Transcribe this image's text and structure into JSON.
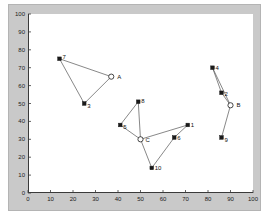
{
  "figure": {
    "width": 269,
    "height": 220,
    "frame_color": "#c9c9c9",
    "plot_background": "#ffffff",
    "axis_color": "#3a3a3a",
    "edge_color": "#555555",
    "node_color": "#1a1a1a",
    "center_color": "#ffffff"
  },
  "chart_data": {
    "type": "scatter",
    "title": "",
    "xlabel": "",
    "ylabel": "",
    "xlim": [
      0,
      100
    ],
    "ylim": [
      0,
      100
    ],
    "grid": false,
    "legend": "none",
    "xticks": [
      0,
      10,
      20,
      30,
      40,
      50,
      60,
      70,
      80,
      90,
      100
    ],
    "yticks": [
      0,
      10,
      20,
      30,
      40,
      50,
      60,
      70,
      80,
      90,
      100
    ],
    "xtick_labels": [
      "0",
      "10",
      "20",
      "30",
      "40",
      "50",
      "60",
      "70",
      "80",
      "90",
      "100"
    ],
    "ytick_labels": [
      "0",
      "10",
      "20",
      "30",
      "40",
      "50",
      "60",
      "70",
      "80",
      "90",
      "100"
    ],
    "series": [
      {
        "name": "nodes",
        "marker": "filled-square",
        "points": [
          {
            "label": "7",
            "x": 14,
            "y": 75,
            "label_dx": 3,
            "label_dy": -5
          },
          {
            "label": "3",
            "x": 25,
            "y": 50,
            "label_dx": 3,
            "label_dy": -1
          },
          {
            "label": "8",
            "x": 49,
            "y": 51,
            "label_dx": 3,
            "label_dy": -4
          },
          {
            "label": "5",
            "x": 41,
            "y": 38,
            "label_dx": 3,
            "label_dy": -1
          },
          {
            "label": "10",
            "x": 55,
            "y": 14,
            "label_dx": 3,
            "label_dy": 0
          },
          {
            "label": "6",
            "x": 65,
            "y": 31,
            "label_dx": 3,
            "label_dy": -3
          },
          {
            "label": "1",
            "x": 71,
            "y": 38,
            "label_dx": 3,
            "label_dy": -3
          },
          {
            "label": "4",
            "x": 82,
            "y": 70,
            "label_dx": 3,
            "label_dy": -3
          },
          {
            "label": "2",
            "x": 86,
            "y": 56,
            "label_dx": 3,
            "label_dy": -2
          },
          {
            "label": "9",
            "x": 86,
            "y": 31,
            "label_dx": 3,
            "label_dy": -1
          }
        ]
      },
      {
        "name": "cluster-centers",
        "marker": "open-circle",
        "points": [
          {
            "label": "A",
            "x": 37,
            "y": 65,
            "label_dx": 6,
            "label_dy": -3
          },
          {
            "label": "B",
            "x": 90,
            "y": 49,
            "label_dx": 6,
            "label_dy": -3
          },
          {
            "label": "C",
            "x": 50,
            "y": 30,
            "label_dx": 5,
            "label_dy": -2
          }
        ]
      }
    ],
    "edges": [
      {
        "from": [
          14,
          75
        ],
        "to": [
          25,
          50
        ]
      },
      {
        "from": [
          14,
          75
        ],
        "to": [
          37,
          65
        ]
      },
      {
        "from": [
          25,
          50
        ],
        "to": [
          37,
          65
        ]
      },
      {
        "from": [
          49,
          51
        ],
        "to": [
          41,
          38
        ]
      },
      {
        "from": [
          49,
          51
        ],
        "to": [
          50,
          30
        ]
      },
      {
        "from": [
          41,
          38
        ],
        "to": [
          50,
          30
        ]
      },
      {
        "from": [
          50,
          30
        ],
        "to": [
          55,
          14
        ]
      },
      {
        "from": [
          50,
          30
        ],
        "to": [
          71,
          38
        ]
      },
      {
        "from": [
          55,
          14
        ],
        "to": [
          65,
          31
        ]
      },
      {
        "from": [
          65,
          31
        ],
        "to": [
          71,
          38
        ]
      },
      {
        "from": [
          82,
          70
        ],
        "to": [
          86,
          56
        ]
      },
      {
        "from": [
          82,
          70
        ],
        "to": [
          90,
          49
        ]
      },
      {
        "from": [
          86,
          56
        ],
        "to": [
          90,
          49
        ]
      },
      {
        "from": [
          90,
          49
        ],
        "to": [
          86,
          31
        ]
      }
    ]
  }
}
